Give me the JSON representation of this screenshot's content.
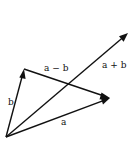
{
  "diagram": {
    "stroke_color": "#111111",
    "background": "#ffffff",
    "origin": [
      6,
      137
    ],
    "vectors": [
      {
        "id": "a",
        "label": "a",
        "from": [
          6,
          137
        ],
        "to": [
          110,
          98
        ],
        "label_pos": [
          61,
          125
        ]
      },
      {
        "id": "b",
        "label": "b",
        "from": [
          6,
          137
        ],
        "to": [
          24,
          69
        ],
        "label_pos": [
          8,
          105
        ]
      },
      {
        "id": "a_minus_b",
        "label": "a − b",
        "from": [
          24,
          69
        ],
        "to": [
          110,
          98
        ],
        "label_pos": [
          44,
          71
        ]
      },
      {
        "id": "a_plus_b",
        "label": "a + b",
        "from": [
          6,
          137
        ],
        "to": [
          128,
          33
        ],
        "label_pos": [
          102,
          68
        ]
      }
    ]
  }
}
